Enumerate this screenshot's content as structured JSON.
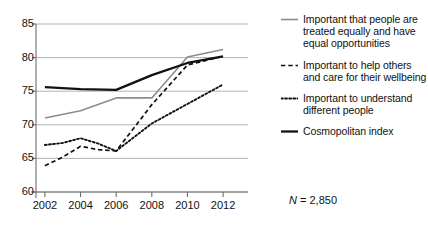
{
  "chart_data": {
    "type": "line",
    "title": "",
    "subtitle": "",
    "xlabel": "",
    "ylabel": "",
    "x": [
      2002,
      2003,
      2004,
      2005,
      2006,
      2007,
      2008,
      2009,
      2010,
      2011,
      2012
    ],
    "categories": [
      "2002",
      "2004",
      "2006",
      "2008",
      "2010",
      "2012"
    ],
    "xlim": [
      2001.5,
      2012.5
    ],
    "ylim": [
      60,
      85
    ],
    "yticks": [
      60,
      65,
      70,
      75,
      80,
      85
    ],
    "xticks": [
      2002,
      2004,
      2006,
      2008,
      2010,
      2012
    ],
    "grid": "horizontal",
    "grid_color": "#aaaaaa",
    "legend_position": "right",
    "annotations": [
      {
        "text": "N = 2,850",
        "x": 2013.2,
        "y": 61.5
      }
    ],
    "series": [
      {
        "name": "Important that people are treated equally and have equal opportunities",
        "style": "solid",
        "color": "#8c8c8c",
        "width": 1.6,
        "x": [
          2002,
          2004,
          2006,
          2008,
          2010,
          2012
        ],
        "values": [
          71.0,
          72.1,
          74.0,
          74.0,
          80.1,
          81.2
        ]
      },
      {
        "name": "Important to help others and care for their wellbeing",
        "style": "dashed",
        "color": "#111111",
        "width": 1.7,
        "x": [
          2002,
          2003,
          2004,
          2005,
          2006,
          2008,
          2010,
          2012
        ],
        "values": [
          63.9,
          65.2,
          66.8,
          66.3,
          66.1,
          73.0,
          78.9,
          80.2
        ]
      },
      {
        "name": "Important to understand different people",
        "style": "dotted",
        "color": "#111111",
        "width": 1.9,
        "x": [
          2002,
          2003,
          2004,
          2005,
          2006,
          2008,
          2010,
          2012
        ],
        "values": [
          67.0,
          67.3,
          68.0,
          67.2,
          66.1,
          70.2,
          73.1,
          76.0
        ]
      },
      {
        "name": "Cosmopolitan index",
        "style": "solid",
        "color": "#111111",
        "width": 2.3,
        "x": [
          2002,
          2004,
          2006,
          2008,
          2010,
          2012
        ],
        "values": [
          75.6,
          75.3,
          75.2,
          77.4,
          79.2,
          80.2
        ]
      }
    ],
    "legend_entries": [
      {
        "label": "Important that people are treated equally and have equal opportunities",
        "style": "solid",
        "color": "#8c8c8c",
        "width": 1.6
      },
      {
        "label": "Important to help others and care for their wellbeing",
        "style": "dashed",
        "color": "#111111",
        "width": 1.7
      },
      {
        "label": "Important to understand different people",
        "style": "dotted",
        "color": "#111111",
        "width": 1.9
      },
      {
        "label": "Cosmopolitan index",
        "style": "solid",
        "color": "#111111",
        "width": 2.3
      }
    ]
  },
  "axis": {
    "y_labels": [
      "85",
      "80",
      "75",
      "70",
      "65",
      "60"
    ],
    "x_labels": [
      "2002",
      "2004",
      "2006",
      "2008",
      "2010",
      "2012"
    ]
  },
  "note": {
    "n_symbol": "N",
    "n_value": " = 2,850",
    "full": "N = 2,850"
  }
}
